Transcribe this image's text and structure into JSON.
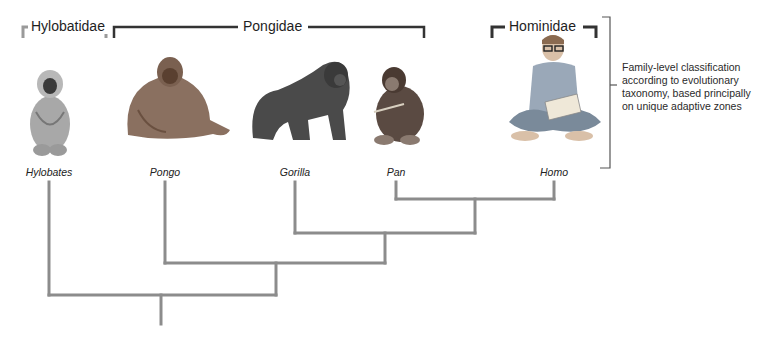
{
  "families": [
    {
      "id": "hylobatidae",
      "label": "Hylobatidae",
      "bracket_color": "#9a9a9a",
      "x_start": 22,
      "x_end": 107,
      "label_x": 28
    },
    {
      "id": "pongidae",
      "label": "Pongidae",
      "bracket_color": "#333333",
      "x_start": 113,
      "x_end": 425,
      "label_x": 242
    },
    {
      "id": "hominidae",
      "label": "Hominidae",
      "bracket_color": "#333333",
      "x_start": 491,
      "x_end": 597,
      "label_x": 508
    }
  ],
  "genera": [
    {
      "id": "hylobates",
      "label": "Hylobates",
      "x": 49,
      "family": "Hylobatidae"
    },
    {
      "id": "pongo",
      "label": "Pongo",
      "x": 165,
      "family": "Pongidae"
    },
    {
      "id": "gorilla",
      "label": "Gorilla",
      "x": 295,
      "family": "Pongidae"
    },
    {
      "id": "pan",
      "label": "Pan",
      "x": 396,
      "family": "Pongidae"
    },
    {
      "id": "homo",
      "label": "Homo",
      "x": 554,
      "family": "Hominidae"
    }
  ],
  "annotation": {
    "text": "Family-level classification according to evolutionary taxonomy, based principally on unique adaptive zones",
    "lines": [
      "Family-level classification",
      "according to evolutionary",
      "taxonomy, based principally",
      "on unique adaptive zones"
    ]
  },
  "tree": {
    "line_color": "#8c8c8c",
    "nodes": [
      {
        "joins": [
          "Pan",
          "Homo"
        ],
        "y": 199,
        "x_left": 396,
        "x_right": 554,
        "stem_x": 475
      },
      {
        "joins": [
          "Gorilla",
          "Pan+Homo"
        ],
        "y": 233,
        "x_left": 295,
        "x_right": 475,
        "stem_x": 385
      },
      {
        "joins": [
          "Pongo",
          "Gorilla+Pan+Homo"
        ],
        "y": 263,
        "x_left": 165,
        "x_right": 385,
        "stem_x": 276
      },
      {
        "joins": [
          "Hylobates",
          "Pongo+Gorilla+Pan+Homo"
        ],
        "y": 295,
        "x_left": 49,
        "x_right": 276,
        "stem_x": 161,
        "root_bottom": 324
      }
    ]
  }
}
